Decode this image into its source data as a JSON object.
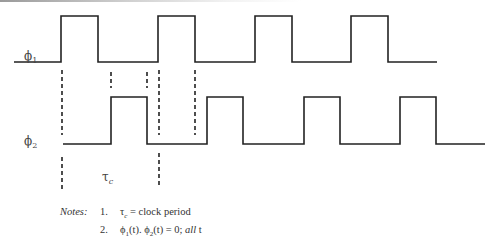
{
  "diagram": {
    "type": "timing-diagram",
    "colors": {
      "waveform": "#222222",
      "dash": "#222222",
      "text": "#444444"
    },
    "signals": [
      {
        "name": "phi1",
        "label": "ϕ",
        "subscript": "1",
        "low_y": 62,
        "high_y": 16,
        "start_x": 14,
        "end_x": 437,
        "pulses": [
          [
            61,
            98
          ],
          [
            158,
            195
          ],
          [
            255,
            292
          ],
          [
            351,
            388
          ]
        ]
      },
      {
        "name": "phi2",
        "label": "ϕ",
        "subscript": "2",
        "low_y": 144,
        "high_y": 97,
        "start_x": 63,
        "end_x": 485,
        "pulses": [
          [
            111,
            147
          ],
          [
            207,
            243
          ],
          [
            304,
            340
          ],
          [
            400,
            436
          ]
        ]
      }
    ],
    "guides_upper": [
      {
        "x": 62,
        "y1": 70,
        "y2": 135
      },
      {
        "x": 111,
        "y1": 72,
        "y2": 88
      },
      {
        "x": 147,
        "y1": 72,
        "y2": 88
      },
      {
        "x": 159,
        "y1": 70,
        "y2": 135
      },
      {
        "x": 195,
        "y1": 70,
        "y2": 135
      }
    ],
    "guides_lower": [
      {
        "x": 62,
        "y1": 157,
        "y2": 192
      },
      {
        "x": 159,
        "y1": 153,
        "y2": 188
      }
    ],
    "tau_label": {
      "symbol": "τ",
      "subscript": "c"
    }
  },
  "notes": {
    "title": "Notes:",
    "items": [
      {
        "num": "1.",
        "text": "τ",
        "sub": "c",
        "rest": " = clock period"
      },
      {
        "num": "2.",
        "text": "ϕ",
        "sub": "1",
        "mid": "(t). ϕ",
        "sub2": "2",
        "rest": "(t) = 0; ",
        "emph": "all",
        "tail": " t"
      }
    ]
  }
}
